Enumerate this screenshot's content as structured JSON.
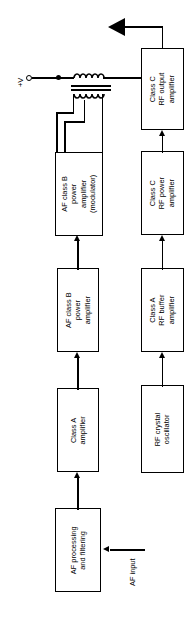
{
  "diagram": {
    "orientation": "rotated-90-ccw",
    "background": "#ffffff",
    "line_color": "#000000"
  },
  "blocks": [
    {
      "id": "af-processing",
      "lines": [
        "AF processing",
        "and filtering"
      ]
    },
    {
      "id": "class-a-amplifier",
      "lines": [
        "Class A",
        "amplifier"
      ]
    },
    {
      "id": "af-class-b-power",
      "lines": [
        "AF class B",
        "power",
        "amplifier"
      ]
    },
    {
      "id": "af-class-b-modulator",
      "lines": [
        "AF class B",
        "power",
        "amplifier",
        "(modulator)"
      ]
    },
    {
      "id": "rf-crystal-oscillator",
      "lines": [
        "RF crystal",
        "oscillator"
      ]
    },
    {
      "id": "class-a-rf-buffer",
      "lines": [
        "Class A",
        "RF buffer",
        "amplifier"
      ]
    },
    {
      "id": "class-c-rf-power",
      "lines": [
        "Class C",
        "RF power",
        "amplifier"
      ]
    },
    {
      "id": "class-c-rf-output",
      "lines": [
        "Class C",
        "RF output",
        "amplifier"
      ]
    }
  ],
  "labels": {
    "supply": "+V",
    "af_input": "AF input"
  },
  "symbols": {
    "antenna": "antenna-icon",
    "transformer": "transformer-icon",
    "supply_terminal": "terminal-circle-icon",
    "junction": "junction-dot-icon"
  }
}
